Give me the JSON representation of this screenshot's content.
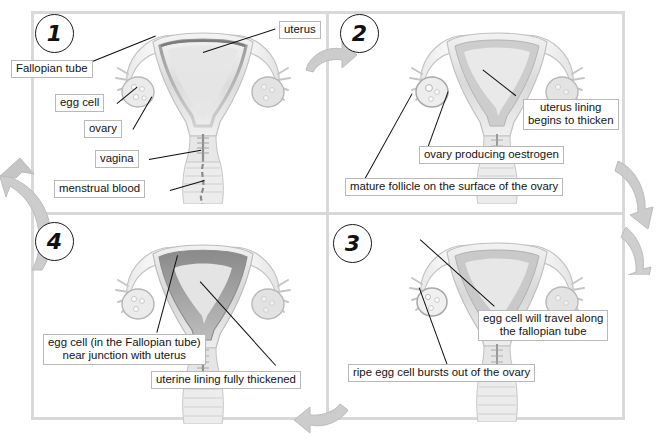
{
  "diagram": {
    "border_color": "#d9d9d9",
    "arrow_color": "#c9c9c9",
    "leader_color": "#0d0d0d",
    "label_bg": "#ffffff",
    "label_border": "#b9b9b9"
  },
  "panels": [
    {
      "number": "1",
      "position": "top-left",
      "labels": [
        {
          "id": "uterus",
          "text": "uterus"
        },
        {
          "id": "fallopian-tube",
          "text": "Fallopian tube"
        },
        {
          "id": "egg-cell",
          "text": "egg cell"
        },
        {
          "id": "ovary",
          "text": "ovary"
        },
        {
          "id": "vagina",
          "text": "vagina"
        },
        {
          "id": "menstrual-blood",
          "text": "menstrual blood"
        }
      ]
    },
    {
      "number": "2",
      "position": "top-right",
      "labels": [
        {
          "id": "uterus-lining",
          "text": "uterus lining\nbegins to thicken"
        },
        {
          "id": "ovary-oestrogen",
          "text": "ovary producing oestrogen"
        },
        {
          "id": "mature-follicle",
          "text": "mature follicle on the surface of the ovary"
        }
      ]
    },
    {
      "number": "3",
      "position": "bottom-right",
      "labels": [
        {
          "id": "egg-travel",
          "text": "egg cell will travel along\nthe fallopian tube"
        },
        {
          "id": "ripe-egg",
          "text": "ripe egg cell bursts out of the ovary"
        }
      ]
    },
    {
      "number": "4",
      "position": "bottom-left",
      "labels": [
        {
          "id": "egg-in-tube",
          "text": "egg cell (in the Fallopian tube)\nnear junction with uterus"
        },
        {
          "id": "uterine-thickened",
          "text": "uterine lining fully thickened"
        }
      ]
    }
  ],
  "flow_arrows": [
    {
      "id": "arrow-top",
      "direction": "right",
      "between": "1 to 2"
    },
    {
      "id": "arrow-right",
      "direction": "down",
      "between": "2 to 3"
    },
    {
      "id": "arrow-bottom",
      "direction": "left",
      "between": "3 to 4"
    },
    {
      "id": "arrow-left",
      "direction": "up",
      "between": "4 to 1"
    }
  ]
}
